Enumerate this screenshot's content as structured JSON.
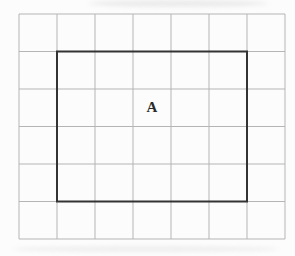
{
  "figure": {
    "label": "A",
    "background_color": "#fcfcfc",
    "grid": {
      "columns": 7,
      "rows": 6,
      "origin_x": 19,
      "origin_y": 14,
      "cell_width": 38,
      "cell_height": 37.5,
      "line_color": "#b5b5b5",
      "line_width": 1
    },
    "rectangle": {
      "x": 57,
      "y": 51.5,
      "width": 190,
      "height": 150,
      "col_start": 1,
      "row_start": 1,
      "col_span": 5,
      "row_span": 4,
      "stroke_color": "#333333",
      "stroke_width": 2
    },
    "label_position": {
      "x": 152,
      "y": 107
    }
  }
}
